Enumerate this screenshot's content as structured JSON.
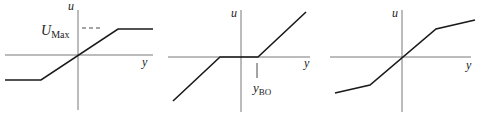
{
  "panels": [
    {
      "name": "saturation",
      "u_label": "u",
      "y_label": "y",
      "annotation_main": "U",
      "annotation_sub": "Max"
    },
    {
      "name": "dead-zone",
      "u_label": "u",
      "y_label": "y",
      "annotation_main": "y",
      "annotation_sub": "BO"
    },
    {
      "name": "gain-change",
      "u_label": "u",
      "y_label": "y"
    }
  ],
  "colors": {
    "axis": "#444444",
    "curve": "#1a1a1a"
  }
}
